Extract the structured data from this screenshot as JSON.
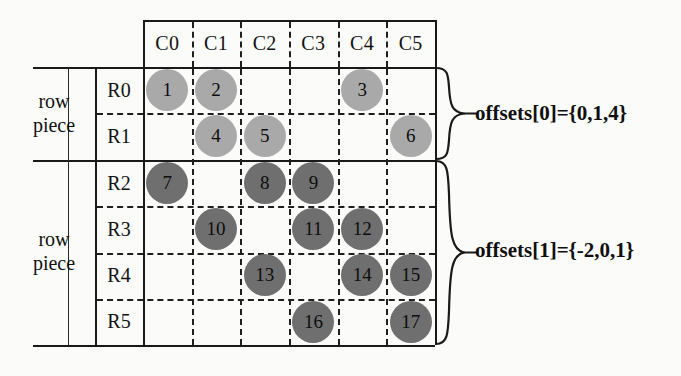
{
  "figure": {
    "kind": "sparse-matrix-row-piece-diagram",
    "colors": {
      "light_bubble": "#a9a9a9",
      "dark_bubble": "#6f6f6f",
      "line": "#1a1a1a",
      "background": "#fbfbfa"
    }
  },
  "grid": {
    "column_headers": [
      "C0",
      "C1",
      "C2",
      "C3",
      "C4",
      "C5"
    ],
    "row_headers": [
      "R0",
      "R1",
      "R2",
      "R3",
      "R4",
      "R5"
    ]
  },
  "row_pieces": [
    {
      "caption_line1": "row",
      "caption_line2": "piece",
      "rows": [
        "R0",
        "R1"
      ],
      "annotation": "offsets[0]={0,1,4}",
      "shade": "light"
    },
    {
      "caption_line1": "row",
      "caption_line2": "piece",
      "rows": [
        "R2",
        "R3",
        "R4",
        "R5"
      ],
      "annotation": "offsets[1]={-2,0,1}",
      "shade": "dark"
    }
  ],
  "entries": [
    {
      "label": "1",
      "row": 0,
      "col": 0,
      "shade": "light"
    },
    {
      "label": "2",
      "row": 0,
      "col": 1,
      "shade": "light"
    },
    {
      "label": "3",
      "row": 0,
      "col": 4,
      "shade": "light"
    },
    {
      "label": "4",
      "row": 1,
      "col": 1,
      "shade": "light"
    },
    {
      "label": "5",
      "row": 1,
      "col": 2,
      "shade": "light"
    },
    {
      "label": "6",
      "row": 1,
      "col": 5,
      "shade": "light"
    },
    {
      "label": "7",
      "row": 2,
      "col": 0,
      "shade": "dark"
    },
    {
      "label": "8",
      "row": 2,
      "col": 2,
      "shade": "dark"
    },
    {
      "label": "9",
      "row": 2,
      "col": 3,
      "shade": "dark"
    },
    {
      "label": "10",
      "row": 3,
      "col": 1,
      "shade": "dark"
    },
    {
      "label": "11",
      "row": 3,
      "col": 3,
      "shade": "dark"
    },
    {
      "label": "12",
      "row": 3,
      "col": 4,
      "shade": "dark"
    },
    {
      "label": "13",
      "row": 4,
      "col": 2,
      "shade": "dark"
    },
    {
      "label": "14",
      "row": 4,
      "col": 4,
      "shade": "dark"
    },
    {
      "label": "15",
      "row": 4,
      "col": 5,
      "shade": "dark"
    },
    {
      "label": "16",
      "row": 5,
      "col": 3,
      "shade": "dark"
    },
    {
      "label": "17",
      "row": 5,
      "col": 5,
      "shade": "dark"
    }
  ]
}
